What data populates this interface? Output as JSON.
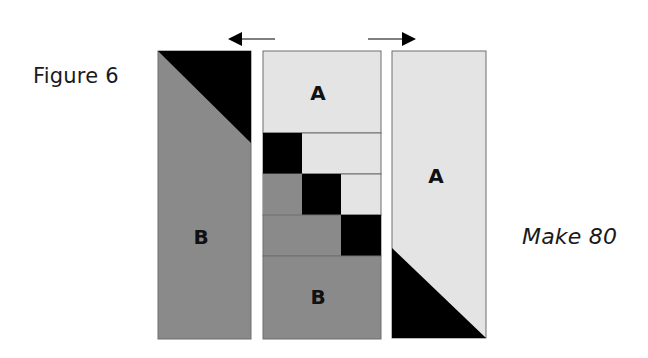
{
  "figure": {
    "label": "Figure 6",
    "instruction": "Make 80"
  },
  "colors": {
    "light": "#e4e4e4",
    "medium": "#8a8a8a",
    "dark": "#000000",
    "outline": "#6e6e6e"
  },
  "left_strip": {
    "label": "B",
    "corner_triangle": "top-right"
  },
  "center_strip": {
    "top_label": "A",
    "bottom_label": "B",
    "rows": [
      {
        "segments": [
          "dark",
          "light"
        ]
      },
      {
        "segments": [
          "medium",
          "dark",
          "light"
        ]
      },
      {
        "segments": [
          "medium",
          "dark"
        ]
      }
    ]
  },
  "right_strip": {
    "label": "A",
    "corner_triangle": "bottom-left"
  },
  "arrows": [
    {
      "direction": "left"
    },
    {
      "direction": "right"
    }
  ]
}
